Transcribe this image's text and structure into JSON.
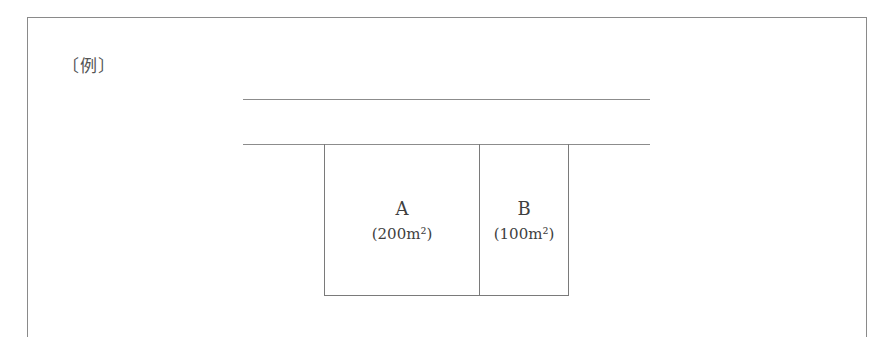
{
  "figure": {
    "label": "〔例〕",
    "road": {
      "description": "road bounded by two parallel lines"
    },
    "lots": [
      {
        "name": "A",
        "area": "(200m²)"
      },
      {
        "name": "B",
        "area": "(100m²)"
      }
    ]
  }
}
